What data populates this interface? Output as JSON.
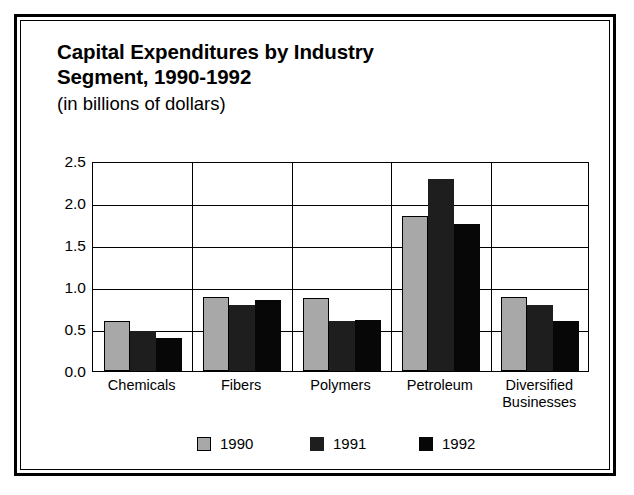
{
  "chart_data": {
    "type": "bar",
    "title": "Capital Expenditures by Industry Segment, 1990-1992",
    "title_line1": "Capital Expenditures by Industry",
    "title_line2": "Segment, 1990-1992",
    "subtitle": "(in billions of dollars)",
    "xlabel": "",
    "ylabel": "",
    "ylim": [
      0.0,
      2.5
    ],
    "y_ticks": [
      "0.0",
      "0.5",
      "1.0",
      "1.5",
      "2.0",
      "2.5"
    ],
    "y_tick_values": [
      0.0,
      0.5,
      1.0,
      1.5,
      2.0,
      2.5
    ],
    "grid": true,
    "legend_position": "bottom",
    "categories": [
      "Chemicals",
      "Fibers",
      "Polymers",
      "Petroleum",
      "Diversified Businesses"
    ],
    "category_lines": [
      [
        "Chemicals"
      ],
      [
        "Fibers"
      ],
      [
        "Polymers"
      ],
      [
        "Petroleum"
      ],
      [
        "Diversified",
        "Businesses"
      ]
    ],
    "series": [
      {
        "name": "1990",
        "color": "#a8a8a8",
        "values": [
          0.6,
          0.88,
          0.87,
          1.85,
          0.88
        ]
      },
      {
        "name": "1991",
        "color": "#1e1e1e",
        "values": [
          0.48,
          0.79,
          0.6,
          2.29,
          0.79
        ]
      },
      {
        "name": "1992",
        "color": "#070707",
        "values": [
          0.39,
          0.84,
          0.61,
          1.75,
          0.6
        ]
      }
    ]
  },
  "legend": {
    "entries": [
      {
        "label": "1990",
        "color": "#a8a8a8"
      },
      {
        "label": "1991",
        "color": "#1e1e1e"
      },
      {
        "label": "1992",
        "color": "#070707"
      }
    ]
  },
  "colors": {
    "frame": "#000000",
    "background": "#ffffff",
    "axis": "#000000",
    "series_1990": "#a8a8a8",
    "series_1991": "#1e1e1e",
    "series_1992": "#070707"
  }
}
